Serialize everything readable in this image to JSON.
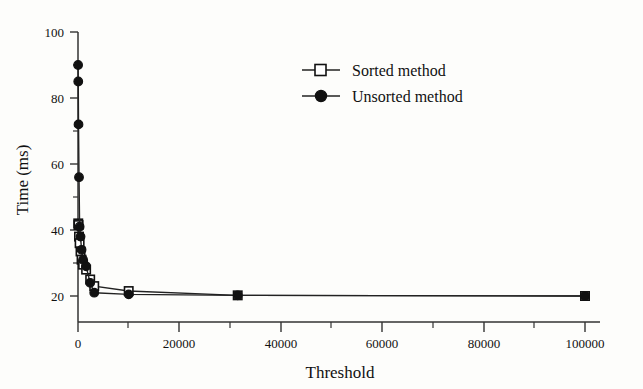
{
  "chart_data": {
    "type": "line",
    "title": "",
    "xlabel": "Threshold",
    "ylabel": "Time (ms)",
    "xlim": [
      0,
      100000
    ],
    "ylim": [
      15,
      100
    ],
    "grid": false,
    "legend_position": "upper-center-right",
    "xticks": [
      0,
      20000,
      40000,
      60000,
      80000,
      100000
    ],
    "xtick_labels": [
      "0",
      "20000",
      "40000",
      "60000",
      "80000",
      "100000"
    ],
    "xminor_ticks": [
      10000,
      30000,
      50000,
      70000,
      90000
    ],
    "yticks": [
      20,
      40,
      60,
      80,
      100
    ],
    "ytick_labels": [
      "20",
      "40",
      "60",
      "80",
      "100"
    ],
    "yminor_ticks": [
      30,
      50,
      70,
      90
    ],
    "series": [
      {
        "name": "Sorted method",
        "marker": "open-square",
        "x": [
          50,
          100,
          200,
          320,
          500,
          700,
          1000,
          1600,
          2400,
          3200,
          10000,
          31500,
          100000
        ],
        "values": [
          42,
          41.5,
          38,
          36,
          33.5,
          31,
          29.5,
          28,
          25,
          23,
          21.5,
          20.2,
          20
        ]
      },
      {
        "name": "Unsorted method",
        "marker": "filled-circle",
        "x": [
          20,
          50,
          100,
          200,
          320,
          500,
          700,
          1000,
          1600,
          2400,
          3200,
          10000,
          31500,
          100000
        ],
        "values": [
          90,
          85,
          72,
          56,
          41,
          38,
          34,
          31,
          29,
          24,
          21,
          20.5,
          20.2,
          20
        ]
      }
    ]
  },
  "legend": {
    "items": [
      {
        "label": "Sorted method",
        "marker": "open-square"
      },
      {
        "label": "Unsorted method",
        "marker": "filled-circle"
      }
    ]
  },
  "colors": {
    "ink": "#111111",
    "axis": "#333333",
    "background": "#fdfdfb",
    "marker_fill_open": "#ffffff"
  }
}
